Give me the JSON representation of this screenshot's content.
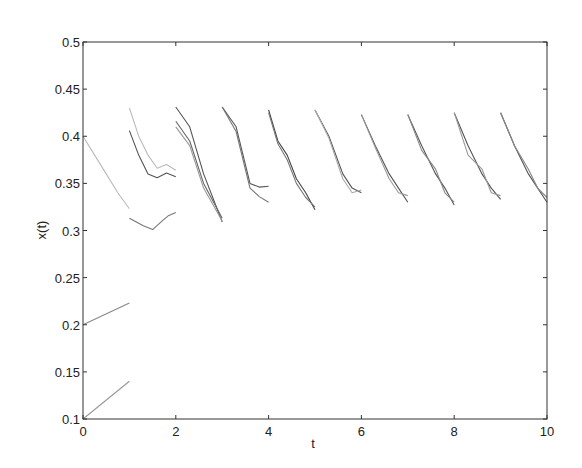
{
  "chart_data": {
    "type": "line",
    "title": "",
    "xlabel": "t",
    "ylabel": "x(t)",
    "xlim": [
      0,
      10
    ],
    "ylim": [
      0.1,
      0.5
    ],
    "grid": false,
    "legend": null,
    "xticks": [
      "0",
      "2",
      "4",
      "6",
      "8",
      "10"
    ],
    "yticks": [
      "0.1",
      "0.15",
      "0.2",
      "0.25",
      "0.3",
      "0.35",
      "0.4",
      "0.45",
      "0.5"
    ],
    "series": [
      {
        "name": "seg0-a",
        "color": "#999999",
        "points": [
          [
            0,
            0.1
          ],
          [
            1,
            0.14
          ]
        ]
      },
      {
        "name": "seg0-b",
        "color": "#888888",
        "points": [
          [
            0,
            0.2
          ],
          [
            1,
            0.223
          ]
        ]
      },
      {
        "name": "seg0-c",
        "color": "#bbbbbb",
        "points": [
          [
            0,
            0.4
          ],
          [
            0.25,
            0.38
          ],
          [
            0.5,
            0.36
          ],
          [
            0.75,
            0.34
          ],
          [
            1,
            0.323
          ]
        ]
      },
      {
        "name": "seg1-a",
        "color": "#bbbbbb",
        "points": [
          [
            1,
            0.43
          ],
          [
            1.2,
            0.4
          ],
          [
            1.4,
            0.38
          ],
          [
            1.6,
            0.366
          ],
          [
            1.8,
            0.37
          ],
          [
            2,
            0.364
          ]
        ]
      },
      {
        "name": "seg1-b",
        "color": "#555555",
        "points": [
          [
            1,
            0.406
          ],
          [
            1.2,
            0.38
          ],
          [
            1.4,
            0.36
          ],
          [
            1.6,
            0.356
          ],
          [
            1.8,
            0.361
          ],
          [
            2,
            0.357
          ]
        ]
      },
      {
        "name": "seg1-c",
        "color": "#777777",
        "points": [
          [
            1,
            0.313
          ],
          [
            1.3,
            0.305
          ],
          [
            1.5,
            0.301
          ],
          [
            1.7,
            0.31
          ],
          [
            1.85,
            0.316
          ],
          [
            2,
            0.319
          ]
        ]
      },
      {
        "name": "seg2-a",
        "color": "#555555",
        "points": [
          [
            2,
            0.431
          ],
          [
            2.3,
            0.41
          ],
          [
            2.6,
            0.36
          ],
          [
            3,
            0.309
          ]
        ]
      },
      {
        "name": "seg2-b",
        "color": "#666666",
        "points": [
          [
            2,
            0.416
          ],
          [
            2.3,
            0.395
          ],
          [
            2.6,
            0.35
          ],
          [
            3,
            0.313
          ]
        ]
      },
      {
        "name": "seg2-c",
        "color": "#999999",
        "points": [
          [
            2,
            0.41
          ],
          [
            2.3,
            0.39
          ],
          [
            2.6,
            0.345
          ],
          [
            3,
            0.31
          ]
        ]
      },
      {
        "name": "seg3-a",
        "color": "#555555",
        "points": [
          [
            3,
            0.431
          ],
          [
            3.3,
            0.41
          ],
          [
            3.6,
            0.35
          ],
          [
            3.8,
            0.346
          ],
          [
            4,
            0.347
          ]
        ]
      },
      {
        "name": "seg3-b",
        "color": "#777777",
        "points": [
          [
            3,
            0.431
          ],
          [
            3.3,
            0.405
          ],
          [
            3.6,
            0.345
          ],
          [
            3.8,
            0.336
          ],
          [
            4,
            0.33
          ]
        ]
      },
      {
        "name": "seg4-a",
        "color": "#444444",
        "points": [
          [
            4,
            0.428
          ],
          [
            4.2,
            0.395
          ],
          [
            4.4,
            0.38
          ],
          [
            4.6,
            0.355
          ],
          [
            4.8,
            0.34
          ],
          [
            5,
            0.322
          ]
        ]
      },
      {
        "name": "seg4-b",
        "color": "#777777",
        "points": [
          [
            4,
            0.425
          ],
          [
            4.2,
            0.392
          ],
          [
            4.4,
            0.375
          ],
          [
            4.6,
            0.35
          ],
          [
            4.8,
            0.335
          ],
          [
            5,
            0.325
          ]
        ]
      },
      {
        "name": "seg5-a",
        "color": "#555555",
        "points": [
          [
            5,
            0.428
          ],
          [
            5.3,
            0.4
          ],
          [
            5.6,
            0.36
          ],
          [
            5.8,
            0.345
          ],
          [
            6,
            0.34
          ]
        ]
      },
      {
        "name": "seg5-b",
        "color": "#aaaaaa",
        "points": [
          [
            5,
            0.428
          ],
          [
            5.3,
            0.398
          ],
          [
            5.6,
            0.355
          ],
          [
            5.8,
            0.34
          ],
          [
            6,
            0.343
          ]
        ]
      },
      {
        "name": "seg6-a",
        "color": "#555555",
        "points": [
          [
            6,
            0.423
          ],
          [
            6.3,
            0.39
          ],
          [
            6.6,
            0.36
          ],
          [
            6.8,
            0.345
          ],
          [
            7,
            0.33
          ]
        ]
      },
      {
        "name": "seg6-b",
        "color": "#999999",
        "points": [
          [
            6,
            0.423
          ],
          [
            6.3,
            0.388
          ],
          [
            6.6,
            0.355
          ],
          [
            6.8,
            0.34
          ],
          [
            7,
            0.337
          ]
        ]
      },
      {
        "name": "seg7-a",
        "color": "#555555",
        "points": [
          [
            7,
            0.423
          ],
          [
            7.3,
            0.39
          ],
          [
            7.6,
            0.36
          ],
          [
            7.8,
            0.345
          ],
          [
            8,
            0.327
          ]
        ]
      },
      {
        "name": "seg7-b",
        "color": "#888888",
        "points": [
          [
            7,
            0.423
          ],
          [
            7.3,
            0.385
          ],
          [
            7.6,
            0.365
          ],
          [
            7.8,
            0.34
          ],
          [
            8,
            0.33
          ]
        ]
      },
      {
        "name": "seg8-a",
        "color": "#555555",
        "points": [
          [
            8,
            0.425
          ],
          [
            8.3,
            0.39
          ],
          [
            8.6,
            0.36
          ],
          [
            8.8,
            0.345
          ],
          [
            9,
            0.333
          ]
        ]
      },
      {
        "name": "seg8-b",
        "color": "#999999",
        "points": [
          [
            8,
            0.425
          ],
          [
            8.3,
            0.38
          ],
          [
            8.6,
            0.365
          ],
          [
            8.8,
            0.34
          ],
          [
            9,
            0.337
          ]
        ]
      },
      {
        "name": "seg9-a",
        "color": "#555555",
        "points": [
          [
            9,
            0.425
          ],
          [
            9.3,
            0.39
          ],
          [
            9.6,
            0.36
          ],
          [
            9.8,
            0.345
          ],
          [
            10,
            0.33
          ]
        ]
      },
      {
        "name": "seg9-b",
        "color": "#888888",
        "points": [
          [
            9,
            0.425
          ],
          [
            9.3,
            0.39
          ],
          [
            9.6,
            0.365
          ],
          [
            9.8,
            0.345
          ],
          [
            10,
            0.335
          ]
        ]
      }
    ]
  }
}
